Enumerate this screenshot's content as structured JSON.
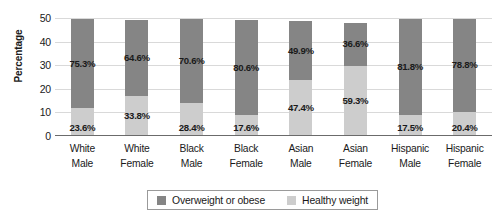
{
  "chart_data": {
    "type": "bar",
    "subtype": "stacked-bar-100",
    "title": "",
    "xlabel": "",
    "ylabel": "Percentage",
    "ylim": [
      0,
      50
    ],
    "yticks": [
      0,
      10,
      20,
      30,
      40,
      50
    ],
    "grid": true,
    "legend_position": "bottom-center",
    "categories": [
      "White Male",
      "White Female",
      "Black Male",
      "Black Female",
      "Asian Male",
      "Asian Female",
      "Hispanic Male",
      "Hispanic Female"
    ],
    "category_lines": [
      [
        "White",
        "Male"
      ],
      [
        "White",
        "Female"
      ],
      [
        "Black",
        "Male"
      ],
      [
        "Black",
        "Female"
      ],
      [
        "Asian",
        "Male"
      ],
      [
        "Asian",
        "Female"
      ],
      [
        "Hispanic",
        "Male"
      ],
      [
        "Hispanic",
        "Female"
      ]
    ],
    "series": [
      {
        "name": "Healthy weight",
        "color": "#cdcdcd",
        "values": [
          23.6,
          33.8,
          28.4,
          17.6,
          47.4,
          59.3,
          17.5,
          20.4
        ],
        "labels": [
          "23.6%",
          "33.8%",
          "28.4%",
          "17.6%",
          "47.4%",
          "59.3%",
          "17.5%",
          "20.4%"
        ]
      },
      {
        "name": "Overweight or obese",
        "color": "#858585",
        "values": [
          75.3,
          64.6,
          70.6,
          80.6,
          49.9,
          36.6,
          81.8,
          78.8
        ],
        "labels": [
          "75.3%",
          "64.6%",
          "70.6%",
          "80.6%",
          "49.9%",
          "36.6%",
          "81.8%",
          "78.8%"
        ]
      }
    ]
  },
  "axis": {
    "y_title": "Percentage",
    "y_ticks": [
      "50",
      "40",
      "30",
      "20",
      "10",
      "0"
    ]
  },
  "legend": {
    "items": [
      {
        "label": "Overweight or obese",
        "color": "#858585"
      },
      {
        "label": "Healthy weight",
        "color": "#cdcdcd"
      }
    ]
  },
  "colors": {
    "overweight": "#858585",
    "healthy": "#cdcdcd",
    "gridline": "#d9d9d9",
    "axis": "#6b6b6b",
    "text": "#1a1a1a",
    "background": "#ffffff"
  }
}
